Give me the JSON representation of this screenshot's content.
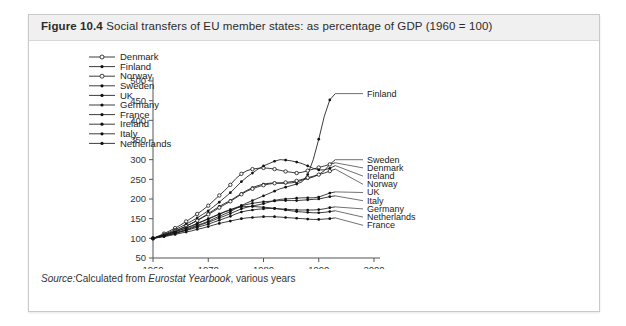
{
  "figure": {
    "number": "Figure 10.4",
    "caption": "Social transfers of EU member states: as percentage of GDP (1960 = 100)",
    "source_prefix": "Source:",
    "source_text_a": "Calculated from ",
    "source_italic": "Eurostat Yearbook",
    "source_text_b": ", various years"
  },
  "chart_data": {
    "type": "line",
    "title": "Social transfers of EU member states: as percentage of GDP (1960 = 100)",
    "xlabel": "Year",
    "ylabel": "",
    "xlim": [
      1960,
      2000
    ],
    "ylim": [
      50,
      500
    ],
    "xticks": [
      1960,
      1970,
      1980,
      1990,
      2000
    ],
    "yticks": [
      50,
      100,
      150,
      200,
      250,
      300,
      350,
      400,
      450,
      500
    ],
    "grid": false,
    "legend_position": "upper-left-inside",
    "marker_styles": {
      "Denmark": "open-circle",
      "Finland": "filled-dot",
      "Norway": "open-circle",
      "Sweden": "filled-dot",
      "UK": "filled-dot",
      "Germany": "filled-dot",
      "France": "filled-dot",
      "Ireland": "filled-dot",
      "Italy": "filled-dot",
      "Netherlands": "filled-dot"
    },
    "x": [
      1960,
      1961,
      1962,
      1963,
      1964,
      1965,
      1966,
      1967,
      1968,
      1969,
      1970,
      1971,
      1972,
      1973,
      1974,
      1975,
      1976,
      1977,
      1978,
      1979,
      1980,
      1981,
      1982,
      1983,
      1984,
      1985,
      1986,
      1987,
      1988,
      1989,
      1990,
      1991,
      1992,
      1993
    ],
    "series": [
      {
        "name": "Finland",
        "end_label": "Finland",
        "values": [
          100,
          103,
          107,
          110,
          114,
          118,
          123,
          128,
          133,
          138,
          143,
          150,
          156,
          162,
          168,
          176,
          183,
          190,
          196,
          202,
          208,
          214,
          220,
          226,
          230,
          234,
          238,
          244,
          262,
          300,
          352,
          410,
          452,
          468
        ]
      },
      {
        "name": "Sweden",
        "end_label": "Sweden",
        "values": [
          100,
          104,
          108,
          113,
          118,
          124,
          131,
          138,
          146,
          154,
          163,
          172,
          181,
          189,
          196,
          205,
          214,
          222,
          229,
          234,
          238,
          240,
          241,
          240,
          240,
          241,
          243,
          248,
          252,
          256,
          262,
          272,
          288,
          300
        ]
      },
      {
        "name": "Denmark",
        "end_label": "Denmark",
        "values": [
          100,
          106,
          112,
          119,
          126,
          134,
          143,
          152,
          162,
          172,
          183,
          196,
          209,
          222,
          236,
          252,
          264,
          272,
          276,
          278,
          279,
          278,
          276,
          273,
          270,
          268,
          266,
          268,
          272,
          276,
          280,
          284,
          288,
          292
        ]
      },
      {
        "name": "Ireland",
        "end_label": "Ireland",
        "values": [
          100,
          105,
          110,
          116,
          122,
          129,
          136,
          144,
          152,
          161,
          170,
          181,
          192,
          204,
          216,
          230,
          244,
          256,
          266,
          276,
          284,
          290,
          296,
          300,
          299,
          297,
          294,
          290,
          284,
          278,
          274,
          274,
          278,
          285
        ]
      },
      {
        "name": "Norway",
        "end_label": "Norway",
        "values": [
          100,
          104,
          109,
          114,
          119,
          125,
          131,
          138,
          145,
          153,
          161,
          169,
          178,
          186,
          194,
          203,
          212,
          220,
          226,
          231,
          235,
          238,
          240,
          241,
          242,
          244,
          246,
          250,
          254,
          258,
          262,
          266,
          271,
          276
        ]
      },
      {
        "name": "UK",
        "end_label": "UK",
        "values": [
          100,
          103,
          106,
          109,
          113,
          117,
          121,
          126,
          131,
          136,
          141,
          146,
          152,
          157,
          163,
          169,
          175,
          179,
          182,
          185,
          188,
          192,
          196,
          199,
          200,
          201,
          202,
          203,
          203,
          203,
          205,
          210,
          215,
          218
        ]
      },
      {
        "name": "Italy",
        "end_label": "Italy",
        "values": [
          100,
          104,
          108,
          112,
          117,
          122,
          127,
          132,
          138,
          144,
          150,
          156,
          162,
          168,
          173,
          178,
          183,
          186,
          189,
          191,
          193,
          194,
          195,
          196,
          196,
          196,
          196,
          197,
          198,
          199,
          200,
          203,
          206,
          208
        ]
      },
      {
        "name": "Germany",
        "end_label": "Germany",
        "values": [
          100,
          103,
          106,
          109,
          112,
          116,
          120,
          124,
          128,
          132,
          136,
          141,
          146,
          151,
          156,
          162,
          167,
          170,
          172,
          174,
          175,
          176,
          176,
          175,
          174,
          173,
          172,
          172,
          172,
          172,
          173,
          175,
          178,
          180
        ]
      },
      {
        "name": "Netherlands",
        "end_label": "Netherlands",
        "values": [
          100,
          104,
          108,
          112,
          116,
          121,
          126,
          131,
          137,
          143,
          149,
          155,
          161,
          167,
          172,
          177,
          180,
          181,
          181,
          180,
          179,
          178,
          176,
          174,
          172,
          170,
          168,
          167,
          166,
          165,
          165,
          166,
          168,
          170
        ]
      },
      {
        "name": "France",
        "end_label": "France",
        "values": [
          100,
          102,
          104,
          107,
          110,
          113,
          116,
          119,
          123,
          126,
          130,
          134,
          138,
          141,
          144,
          147,
          150,
          152,
          153,
          154,
          155,
          155,
          155,
          154,
          153,
          152,
          151,
          150,
          149,
          148,
          148,
          149,
          150,
          152
        ]
      }
    ],
    "legend_entries": [
      "Denmark",
      "Finland",
      "Norway",
      "Sweden",
      "UK",
      "Germany",
      "France",
      "Ireland",
      "Italy",
      "Netherlands"
    ]
  }
}
